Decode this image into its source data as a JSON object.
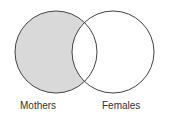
{
  "diagram": {
    "type": "venn",
    "sets": [
      {
        "label": "Mothers",
        "cx": 56,
        "cy": 52,
        "r": 41,
        "shaded": "exclusive-region"
      },
      {
        "label": "Females",
        "cx": 113,
        "cy": 52,
        "r": 41,
        "shaded": "none"
      }
    ],
    "shade_color": "#d9d9d9",
    "stroke_color": "#444444"
  },
  "labels": {
    "left": "Mothers",
    "right": "Females"
  }
}
